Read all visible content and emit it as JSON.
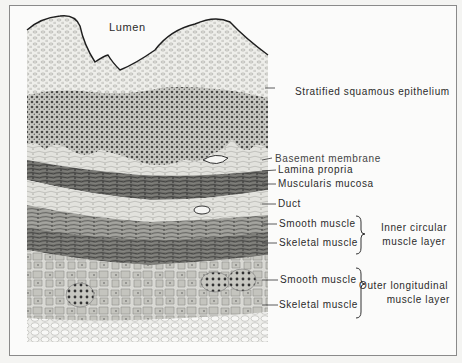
{
  "figure": {
    "labels": {
      "lumen": "Lumen",
      "epithelium": "Stratified squamous epithelium",
      "basement_membrane": "Basement membrane",
      "lamina_propria": "Lamina propria",
      "muscularis_mucosa": "Muscularis mucosa",
      "duct": "Duct",
      "inner_smooth": "Smooth muscle",
      "inner_skeletal": "Skeletal muscle",
      "inner_group_line1": "Inner circular",
      "inner_group_line2": "muscle layer",
      "outer_smooth": "Smooth muscle",
      "outer_skeletal": "Skeletal muscle",
      "outer_group_line1": "Outer longitudinal",
      "outer_group_line2": "muscle layer"
    }
  }
}
